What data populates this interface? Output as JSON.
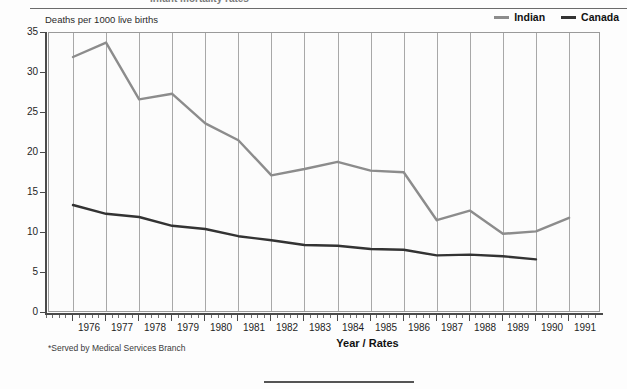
{
  "header": {
    "clipped_title": "Infant mortality rates",
    "y_axis_caption": "Deaths per 1000 live births"
  },
  "legend": {
    "position": "top-right",
    "items": [
      {
        "label": "Indian",
        "color": "#8c8c8c",
        "icon": "line-swatch"
      },
      {
        "label": "Canada",
        "color": "#333333",
        "icon": "line-swatch"
      }
    ]
  },
  "axes": {
    "x_title": "Year / Rates",
    "y_tick_labels": [
      "35",
      "30",
      "25",
      "20",
      "15",
      "10",
      "5",
      "0"
    ],
    "x_tick_labels": [
      "1976",
      "1977",
      "1978",
      "1979",
      "1980",
      "1981",
      "1982",
      "1983",
      "1984",
      "1985",
      "1986",
      "1987",
      "1988",
      "1989",
      "1990",
      "1991"
    ]
  },
  "footnote": "*Served by Medical Services Branch",
  "chart_data": {
    "type": "line",
    "title": "Infant mortality rates",
    "xlabel": "Year / Rates",
    "ylabel": "Deaths per 1000 live births",
    "x": [
      1976,
      1977,
      1978,
      1979,
      1980,
      1981,
      1982,
      1983,
      1984,
      1985,
      1986,
      1987,
      1988,
      1989,
      1990,
      1991
    ],
    "categories": [
      "1976",
      "1977",
      "1978",
      "1979",
      "1980",
      "1981",
      "1982",
      "1983",
      "1984",
      "1985",
      "1986",
      "1987",
      "1988",
      "1989",
      "1990",
      "1991"
    ],
    "ylim": [
      0,
      35
    ],
    "yticks": [
      0,
      5,
      10,
      15,
      20,
      25,
      30,
      35
    ],
    "grid": "vertical",
    "legend_position": "top-right",
    "series": [
      {
        "name": "Indian",
        "color": "#8c8c8c",
        "values": [
          32.0,
          33.8,
          26.7,
          27.4,
          23.7,
          21.6,
          17.2,
          18.0,
          18.9,
          17.8,
          17.6,
          11.6,
          12.8,
          9.9,
          10.2,
          11.9
        ]
      },
      {
        "name": "Canada",
        "color": "#333333",
        "values": [
          13.5,
          12.4,
          12.0,
          10.9,
          10.5,
          9.6,
          9.1,
          8.5,
          8.4,
          8.0,
          7.9,
          7.2,
          7.3,
          7.1,
          6.7,
          null
        ]
      }
    ]
  }
}
